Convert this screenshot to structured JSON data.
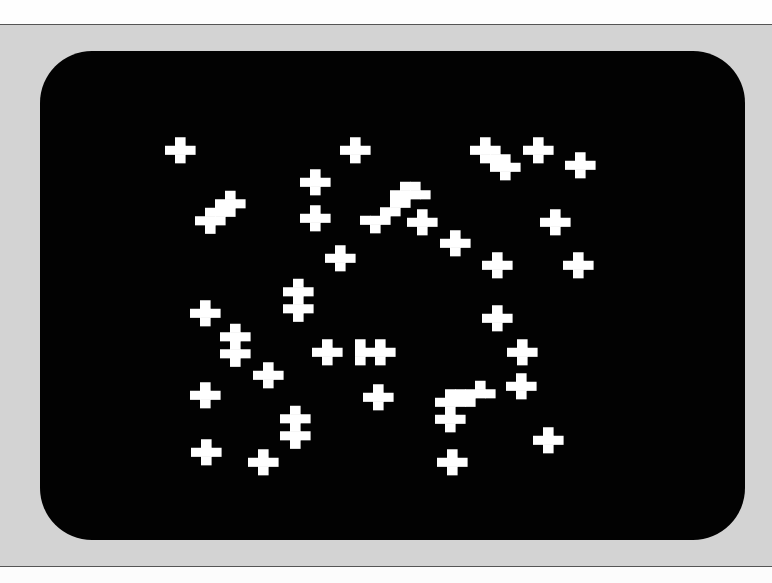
{
  "scene": {
    "description": "Photograph of a CRT display showing a cellular-automaton pattern of white cross-shaped cell clusters",
    "colors": {
      "bezel": "#d3d3d3",
      "screen": "#020202",
      "cell": "#ffffff",
      "paper": "#fefefe"
    }
  },
  "cell_size": 10,
  "clusters": [
    {
      "x": 180,
      "y": 150,
      "cells": [
        [
          0,
          -1
        ],
        [
          -1,
          0
        ],
        [
          0,
          0
        ],
        [
          1,
          0
        ],
        [
          0,
          1
        ]
      ]
    },
    {
      "x": 355,
      "y": 150,
      "cells": [
        [
          0,
          -1
        ],
        [
          -1,
          0
        ],
        [
          0,
          0
        ],
        [
          1,
          0
        ],
        [
          0,
          1
        ]
      ]
    },
    {
      "x": 315,
      "y": 182,
      "cells": [
        [
          0,
          -1
        ],
        [
          -1,
          0
        ],
        [
          0,
          0
        ],
        [
          1,
          0
        ],
        [
          0,
          1
        ]
      ]
    },
    {
      "x": 315,
      "y": 218,
      "cells": [
        [
          0,
          -1
        ],
        [
          -1,
          0
        ],
        [
          0,
          0
        ],
        [
          1,
          0
        ],
        [
          0,
          1
        ]
      ]
    },
    {
      "x": 340,
      "y": 258,
      "cells": [
        [
          0,
          -1
        ],
        [
          -1,
          0
        ],
        [
          0,
          0
        ],
        [
          1,
          0
        ],
        [
          0,
          1
        ]
      ]
    },
    {
      "x": 485,
      "y": 150,
      "cells": [
        [
          0,
          -1
        ],
        [
          -1,
          0
        ],
        [
          0,
          0
        ],
        [
          1,
          0
        ],
        [
          0,
          1
        ],
        [
          1,
          1
        ],
        [
          2,
          1
        ],
        [
          1,
          2
        ],
        [
          2,
          2
        ],
        [
          3,
          2
        ],
        [
          2,
          3
        ]
      ]
    },
    {
      "x": 538,
      "y": 150,
      "cells": [
        [
          0,
          -1
        ],
        [
          -1,
          0
        ],
        [
          0,
          0
        ],
        [
          1,
          0
        ],
        [
          0,
          1
        ]
      ]
    },
    {
      "x": 580,
      "y": 165,
      "cells": [
        [
          0,
          -1
        ],
        [
          -1,
          0
        ],
        [
          0,
          0
        ],
        [
          1,
          0
        ],
        [
          0,
          1
        ]
      ]
    },
    {
      "x": 210,
      "y": 212,
      "cells": [
        [
          2,
          -2
        ],
        [
          1,
          -1
        ],
        [
          2,
          -1
        ],
        [
          3,
          -1
        ],
        [
          0,
          0
        ],
        [
          1,
          0
        ],
        [
          2,
          0
        ],
        [
          -1,
          1
        ],
        [
          0,
          1
        ],
        [
          1,
          1
        ],
        [
          0,
          2
        ]
      ]
    },
    {
      "x": 395,
      "y": 203,
      "cells": [
        [
          2,
          -2
        ],
        [
          1,
          -2
        ],
        [
          3,
          -1
        ],
        [
          1,
          -1
        ],
        [
          2,
          -1
        ],
        [
          0,
          0
        ],
        [
          1,
          0
        ],
        [
          0,
          -1
        ],
        [
          -1,
          1
        ],
        [
          0,
          1
        ],
        [
          -2,
          2
        ],
        [
          -1,
          2
        ],
        [
          -3,
          2
        ],
        [
          -2,
          3
        ]
      ]
    },
    {
      "x": 422,
      "y": 222,
      "cells": [
        [
          0,
          -1
        ],
        [
          -1,
          0
        ],
        [
          0,
          0
        ],
        [
          1,
          0
        ],
        [
          0,
          1
        ]
      ]
    },
    {
      "x": 455,
      "y": 243,
      "cells": [
        [
          0,
          -1
        ],
        [
          -1,
          0
        ],
        [
          0,
          0
        ],
        [
          1,
          0
        ],
        [
          0,
          1
        ]
      ]
    },
    {
      "x": 555,
      "y": 222,
      "cells": [
        [
          0,
          -1
        ],
        [
          -1,
          0
        ],
        [
          0,
          0
        ],
        [
          1,
          0
        ],
        [
          0,
          1
        ]
      ]
    },
    {
      "x": 497,
      "y": 265,
      "cells": [
        [
          0,
          -1
        ],
        [
          -1,
          0
        ],
        [
          0,
          0
        ],
        [
          1,
          0
        ],
        [
          0,
          1
        ]
      ]
    },
    {
      "x": 578,
      "y": 265,
      "cells": [
        [
          0,
          -1
        ],
        [
          -1,
          0
        ],
        [
          0,
          0
        ],
        [
          1,
          0
        ],
        [
          0,
          1
        ]
      ]
    },
    {
      "x": 298,
      "y": 300,
      "cells": [
        [
          0,
          -2
        ],
        [
          -1,
          -1
        ],
        [
          0,
          -1
        ],
        [
          1,
          -1
        ],
        [
          0,
          0
        ],
        [
          -1,
          1
        ],
        [
          0,
          1
        ],
        [
          1,
          1
        ],
        [
          0,
          2
        ]
      ]
    },
    {
      "x": 205,
      "y": 313,
      "cells": [
        [
          0,
          -1
        ],
        [
          -1,
          0
        ],
        [
          0,
          0
        ],
        [
          1,
          0
        ],
        [
          0,
          1
        ]
      ]
    },
    {
      "x": 235,
      "y": 345,
      "cells": [
        [
          0,
          -2
        ],
        [
          -1,
          -1
        ],
        [
          0,
          -1
        ],
        [
          1,
          -1
        ],
        [
          0,
          0
        ],
        [
          -1,
          1
        ],
        [
          0,
          1
        ],
        [
          1,
          1
        ],
        [
          0,
          2
        ]
      ]
    },
    {
      "x": 497,
      "y": 318,
      "cells": [
        [
          0,
          -1
        ],
        [
          -1,
          0
        ],
        [
          0,
          0
        ],
        [
          1,
          0
        ],
        [
          0,
          1
        ]
      ]
    },
    {
      "x": 327,
      "y": 352,
      "cells": [
        [
          0,
          -1
        ],
        [
          -1,
          0
        ],
        [
          0,
          0
        ],
        [
          1,
          0
        ],
        [
          0,
          1
        ]
      ]
    },
    {
      "x": 380,
      "y": 352,
      "cells": [
        [
          -2,
          0
        ],
        [
          -1,
          0
        ],
        [
          0,
          -1
        ],
        [
          0,
          0
        ],
        [
          1,
          0
        ],
        [
          0,
          1
        ],
        [
          -2,
          -1
        ],
        [
          -2,
          1
        ]
      ]
    },
    {
      "x": 522,
      "y": 352,
      "cells": [
        [
          0,
          -1
        ],
        [
          -1,
          0
        ],
        [
          0,
          0
        ],
        [
          1,
          0
        ],
        [
          0,
          1
        ]
      ]
    },
    {
      "x": 268,
      "y": 375,
      "cells": [
        [
          0,
          -1
        ],
        [
          -1,
          0
        ],
        [
          0,
          0
        ],
        [
          1,
          0
        ],
        [
          0,
          1
        ]
      ]
    },
    {
      "x": 205,
      "y": 395,
      "cells": [
        [
          0,
          -1
        ],
        [
          -1,
          0
        ],
        [
          0,
          0
        ],
        [
          1,
          0
        ],
        [
          0,
          1
        ]
      ]
    },
    {
      "x": 378,
      "y": 397,
      "cells": [
        [
          0,
          -1
        ],
        [
          -1,
          0
        ],
        [
          0,
          0
        ],
        [
          1,
          0
        ],
        [
          0,
          1
        ]
      ]
    },
    {
      "x": 450,
      "y": 402,
      "cells": [
        [
          3,
          -2
        ],
        [
          2,
          -1
        ],
        [
          3,
          -1
        ],
        [
          4,
          -1
        ],
        [
          0,
          -1
        ],
        [
          1,
          -1
        ],
        [
          -1,
          0
        ],
        [
          0,
          0
        ],
        [
          1,
          0
        ],
        [
          2,
          0
        ],
        [
          0,
          1
        ],
        [
          -1,
          2
        ],
        [
          0,
          2
        ],
        [
          1,
          2
        ],
        [
          0,
          3
        ]
      ]
    },
    {
      "x": 521,
      "y": 386,
      "cells": [
        [
          0,
          -1
        ],
        [
          -1,
          0
        ],
        [
          0,
          0
        ],
        [
          1,
          0
        ],
        [
          0,
          1
        ]
      ]
    },
    {
      "x": 295,
      "y": 427,
      "cells": [
        [
          0,
          -2
        ],
        [
          -1,
          -1
        ],
        [
          0,
          -1
        ],
        [
          1,
          -1
        ],
        [
          0,
          0
        ],
        [
          -1,
          1
        ],
        [
          0,
          1
        ],
        [
          1,
          1
        ],
        [
          0,
          2
        ]
      ]
    },
    {
      "x": 206,
      "y": 452,
      "cells": [
        [
          0,
          -1
        ],
        [
          -1,
          0
        ],
        [
          0,
          0
        ],
        [
          1,
          0
        ],
        [
          0,
          1
        ]
      ]
    },
    {
      "x": 263,
      "y": 462,
      "cells": [
        [
          0,
          -1
        ],
        [
          -1,
          0
        ],
        [
          0,
          0
        ],
        [
          1,
          0
        ],
        [
          0,
          1
        ]
      ]
    },
    {
      "x": 548,
      "y": 440,
      "cells": [
        [
          0,
          -1
        ],
        [
          -1,
          0
        ],
        [
          0,
          0
        ],
        [
          1,
          0
        ],
        [
          0,
          1
        ]
      ]
    },
    {
      "x": 452,
      "y": 462,
      "cells": [
        [
          0,
          -1
        ],
        [
          -1,
          0
        ],
        [
          0,
          0
        ],
        [
          1,
          0
        ],
        [
          0,
          1
        ]
      ]
    }
  ]
}
